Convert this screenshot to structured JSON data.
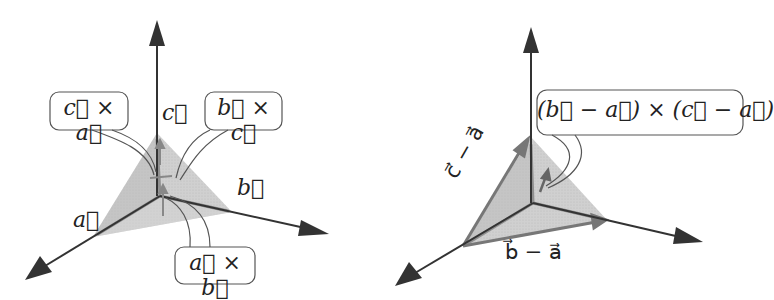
{
  "figure": {
    "left_diagram": {
      "axis_labels": {
        "a": "a⃗",
        "b": "b⃗",
        "c": "c⃗"
      },
      "callouts": [
        {
          "id": "c-cross-a",
          "text": "c⃗ × a⃗"
        },
        {
          "id": "b-cross-c",
          "text": "b⃗ × c⃗"
        },
        {
          "id": "a-cross-b",
          "text": "a⃗ × b⃗"
        }
      ]
    },
    "right_diagram": {
      "edge_labels": {
        "c_minus_a": "c⃗ − a⃗",
        "b_minus_a": "b⃗ − a⃗"
      },
      "callout": {
        "id": "normal",
        "text": "(b⃗ − a⃗) × (c⃗ − a⃗)"
      }
    },
    "colors": {
      "axis": "#333333",
      "triangle_fill": "#bdbdbd",
      "triangle_edge": "#8a8a8a",
      "callout_border": "#555555"
    }
  }
}
